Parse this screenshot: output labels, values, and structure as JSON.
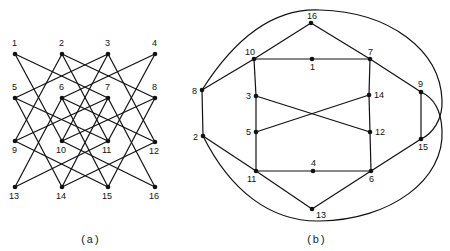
{
  "figure": {
    "panels": [
      {
        "id": "a",
        "caption": "(a)",
        "nodes": [
          {
            "id": "1",
            "label": "1",
            "x": 15,
            "y": 54,
            "lx": 12,
            "ly": 46
          },
          {
            "id": "2",
            "label": "2",
            "x": 62,
            "y": 54,
            "lx": 59,
            "ly": 46
          },
          {
            "id": "3",
            "label": "3",
            "x": 108,
            "y": 54,
            "lx": 105,
            "ly": 46
          },
          {
            "id": "4",
            "label": "4",
            "x": 155,
            "y": 54,
            "lx": 152,
            "ly": 46
          },
          {
            "id": "5",
            "label": "5",
            "x": 15,
            "y": 98,
            "lx": 12,
            "ly": 90
          },
          {
            "id": "6",
            "label": "6",
            "x": 62,
            "y": 98,
            "lx": 59,
            "ly": 90
          },
          {
            "id": "7",
            "label": "7",
            "x": 108,
            "y": 98,
            "lx": 105,
            "ly": 90
          },
          {
            "id": "8",
            "label": "8",
            "x": 155,
            "y": 98,
            "lx": 152,
            "ly": 90
          },
          {
            "id": "9",
            "label": "9",
            "x": 15,
            "y": 141,
            "lx": 12,
            "ly": 153
          },
          {
            "id": "10",
            "label": "10",
            "x": 62,
            "y": 141,
            "lx": 56,
            "ly": 153
          },
          {
            "id": "11",
            "label": "11",
            "x": 108,
            "y": 141,
            "lx": 102,
            "ly": 153
          },
          {
            "id": "12",
            "label": "12",
            "x": 155,
            "y": 142,
            "lx": 149,
            "ly": 154
          },
          {
            "id": "13",
            "label": "13",
            "x": 15,
            "y": 187,
            "lx": 9,
            "ly": 199
          },
          {
            "id": "14",
            "label": "14",
            "x": 62,
            "y": 187,
            "lx": 56,
            "ly": 199
          },
          {
            "id": "15",
            "label": "15",
            "x": 108,
            "y": 187,
            "lx": 102,
            "ly": 199
          },
          {
            "id": "16",
            "label": "16",
            "x": 155,
            "y": 187,
            "lx": 149,
            "ly": 199
          }
        ],
        "edges": [
          [
            "1",
            "7"
          ],
          [
            "1",
            "10"
          ],
          [
            "2",
            "8"
          ],
          [
            "2",
            "9"
          ],
          [
            "2",
            "11"
          ],
          [
            "3",
            "5"
          ],
          [
            "3",
            "10"
          ],
          [
            "3",
            "12"
          ],
          [
            "4",
            "6"
          ],
          [
            "4",
            "11"
          ],
          [
            "5",
            "11"
          ],
          [
            "5",
            "14"
          ],
          [
            "6",
            "12"
          ],
          [
            "6",
            "13"
          ],
          [
            "6",
            "15"
          ],
          [
            "7",
            "9"
          ],
          [
            "7",
            "14"
          ],
          [
            "7",
            "16"
          ],
          [
            "8",
            "10"
          ],
          [
            "8",
            "15"
          ],
          [
            "9",
            "15"
          ],
          [
            "10",
            "16"
          ],
          [
            "11",
            "13"
          ],
          [
            "12",
            "14"
          ]
        ]
      },
      {
        "id": "b",
        "caption": "(b)",
        "nodes": [
          {
            "id": "16",
            "label": "16",
            "x": 311,
            "y": 23,
            "lx": 307,
            "ly": 19
          },
          {
            "id": "10",
            "label": "10",
            "x": 254,
            "y": 59,
            "lx": 245,
            "ly": 55
          },
          {
            "id": "1",
            "label": "1",
            "x": 312,
            "y": 59,
            "lx": 310,
            "ly": 70
          },
          {
            "id": "7",
            "label": "7",
            "x": 370,
            "y": 59,
            "lx": 368,
            "ly": 55
          },
          {
            "id": "8",
            "label": "8",
            "x": 202,
            "y": 90,
            "lx": 192,
            "ly": 94
          },
          {
            "id": "3",
            "label": "3",
            "x": 256,
            "y": 96,
            "lx": 246,
            "ly": 99
          },
          {
            "id": "14",
            "label": "14",
            "x": 369,
            "y": 95,
            "lx": 374,
            "ly": 98
          },
          {
            "id": "9",
            "label": "9",
            "x": 421,
            "y": 92,
            "lx": 418,
            "ly": 87
          },
          {
            "id": "5",
            "label": "5",
            "x": 256,
            "y": 132,
            "lx": 246,
            "ly": 135
          },
          {
            "id": "12",
            "label": "12",
            "x": 370,
            "y": 132,
            "lx": 375,
            "ly": 135
          },
          {
            "id": "2",
            "label": "2",
            "x": 203,
            "y": 136,
            "lx": 193,
            "ly": 140
          },
          {
            "id": "15",
            "label": "15",
            "x": 421,
            "y": 139,
            "lx": 418,
            "ly": 150
          },
          {
            "id": "11",
            "label": "11",
            "x": 256,
            "y": 171,
            "lx": 247,
            "ly": 182
          },
          {
            "id": "4",
            "label": "4",
            "x": 313,
            "y": 171,
            "lx": 311,
            "ly": 166
          },
          {
            "id": "6",
            "label": "6",
            "x": 371,
            "y": 171,
            "lx": 369,
            "ly": 182
          },
          {
            "id": "13",
            "label": "13",
            "x": 312,
            "y": 209,
            "lx": 316,
            "ly": 218
          }
        ],
        "edges": [
          [
            "16",
            "10"
          ],
          [
            "16",
            "7"
          ],
          [
            "10",
            "1"
          ],
          [
            "1",
            "7"
          ],
          [
            "10",
            "8"
          ],
          [
            "10",
            "3"
          ],
          [
            "3",
            "5"
          ],
          [
            "7",
            "14"
          ],
          [
            "14",
            "12"
          ],
          [
            "12",
            "6"
          ],
          [
            "7",
            "9"
          ],
          [
            "9",
            "15"
          ],
          [
            "3",
            "12"
          ],
          [
            "14",
            "5"
          ],
          [
            "5",
            "11"
          ],
          [
            "8",
            "2"
          ],
          [
            "2",
            "11"
          ],
          [
            "11",
            "4"
          ],
          [
            "4",
            "6"
          ],
          [
            "11",
            "13"
          ],
          [
            "13",
            "6"
          ],
          [
            "6",
            "15"
          ]
        ],
        "curved_edges": [
          {
            "from": "8",
            "to": "15",
            "path": "M202,90 C240,30 280,8 320,10 C390,12 440,50 442,100 C443,120 432,134 421,139"
          },
          {
            "from": "2",
            "to": "9",
            "path": "M203,136 C230,190 270,222 320,221 C390,220 445,180 442,130 C441,108 432,97 421,92"
          }
        ]
      }
    ]
  }
}
